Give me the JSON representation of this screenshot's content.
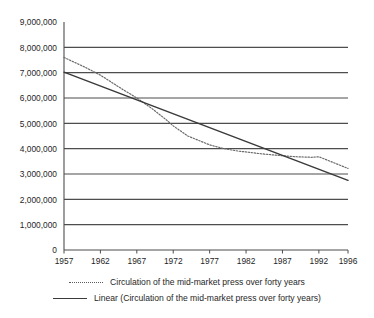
{
  "chart_data": {
    "type": "line",
    "title": "",
    "subtitle": "",
    "xlabel": "",
    "ylabel": "",
    "grid": "horizontal",
    "legend_position": "bottom",
    "x": [
      1957,
      1962,
      1967,
      1972,
      1977,
      1982,
      1987,
      1992,
      1996
    ],
    "categories": [
      "1957",
      "1962",
      "1967",
      "1972",
      "1977",
      "1982",
      "1987",
      "1992",
      "1996"
    ],
    "xlim": [
      1957,
      1996
    ],
    "ylim": [
      0,
      9000000
    ],
    "ytick_values": [
      0,
      1000000,
      2000000,
      3000000,
      4000000,
      5000000,
      6000000,
      7000000,
      8000000,
      9000000
    ],
    "ytick_labels": [
      "0",
      "1,000,000",
      "2,000,000",
      "3,000,000",
      "4,000,000",
      "5,000,000",
      "6,000,000",
      "7,000,000",
      "8,000,000",
      "9,000,000"
    ],
    "series": [
      {
        "name": "Circulation of the mid-market press over forty years",
        "style": "dotted",
        "color": "#6b6b6b",
        "x": [
          1957,
          1960,
          1962,
          1965,
          1967,
          1969,
          1971,
          1972,
          1974,
          1977,
          1979,
          1981,
          1982,
          1984,
          1987,
          1989,
          1991,
          1992,
          1994,
          1996
        ],
        "values": [
          7600000,
          7200000,
          6900000,
          6350000,
          6000000,
          5600000,
          5150000,
          4900000,
          4500000,
          4150000,
          4000000,
          3900000,
          3870000,
          3800000,
          3720000,
          3680000,
          3660000,
          3680000,
          3450000,
          3220000
        ]
      },
      {
        "name": "Linear (Circulation of the mid-market press over forty years)",
        "style": "solid",
        "color": "#3a3a3a",
        "x": [
          1957,
          1996
        ],
        "values": [
          7020000,
          2750000
        ]
      }
    ]
  },
  "legend": {
    "items": [
      {
        "label": "Circulation of the mid-market press over forty years",
        "style": "dotted"
      },
      {
        "label": "Linear (Circulation of the mid-market press over forty years)",
        "style": "solid"
      }
    ]
  }
}
